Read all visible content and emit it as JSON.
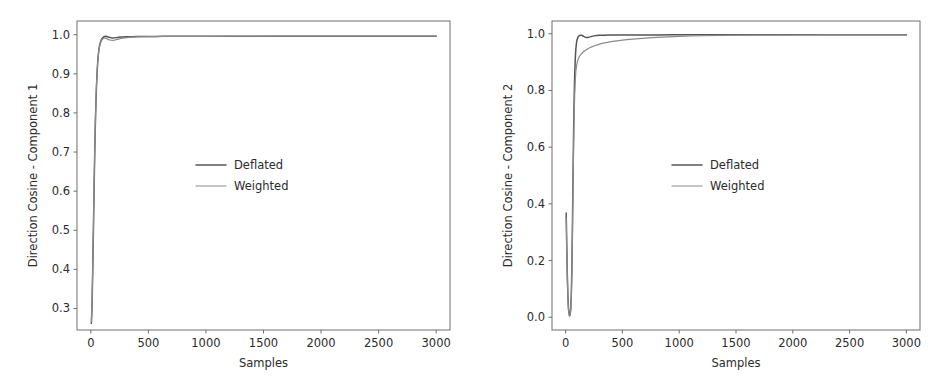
{
  "figure": {
    "background": "#ffffff",
    "width": 949,
    "height": 384,
    "panel_count": 2
  },
  "colors": {
    "deflated": "#555555",
    "weighted": "#8a8a8a",
    "axis": "#6e6e6e",
    "text": "#2b2b2b",
    "background": "#ffffff"
  },
  "chart_data": [
    {
      "type": "line",
      "title": "",
      "panel_name": "component-1",
      "xlabel": "Samples",
      "ylabel": "Direction Cosine - Component 1",
      "xlim": [
        -120,
        3120
      ],
      "ylim": [
        0.245,
        1.035
      ],
      "xticks": [
        0,
        500,
        1000,
        1500,
        2000,
        2500,
        3000
      ],
      "xticklabels": [
        "0",
        "500",
        "1000",
        "1500",
        "2000",
        "2500",
        "3000"
      ],
      "yticks": [
        0.3,
        0.4,
        0.5,
        0.6,
        0.7,
        0.8,
        0.9,
        1.0
      ],
      "yticklabels": [
        "0.3",
        "0.4",
        "0.5",
        "0.6",
        "0.7",
        "0.8",
        "0.9",
        "1.0"
      ],
      "grid": false,
      "legend_position": "center",
      "series": [
        {
          "name": "Deflated",
          "color": "#555555",
          "linewidth": 1.5,
          "x": [
            5,
            10,
            15,
            20,
            25,
            30,
            35,
            40,
            45,
            50,
            55,
            60,
            65,
            70,
            75,
            80,
            85,
            90,
            95,
            100,
            110,
            120,
            130,
            140,
            150,
            160,
            175,
            190,
            205,
            220,
            240,
            260,
            280,
            300,
            330,
            360,
            400,
            450,
            500,
            560,
            620,
            700,
            800,
            900,
            1000,
            1200,
            1400,
            1600,
            1800,
            2000,
            2200,
            2400,
            2600,
            2800,
            3000
          ],
          "y": [
            0.262,
            0.3,
            0.372,
            0.455,
            0.545,
            0.632,
            0.712,
            0.778,
            0.832,
            0.874,
            0.906,
            0.93,
            0.948,
            0.961,
            0.97,
            0.977,
            0.982,
            0.986,
            0.989,
            0.991,
            0.994,
            0.9955,
            0.9958,
            0.9952,
            0.9942,
            0.9932,
            0.9922,
            0.9918,
            0.992,
            0.9925,
            0.9932,
            0.9938,
            0.9942,
            0.9945,
            0.9948,
            0.995,
            0.9952,
            0.9954,
            0.9955,
            0.9956,
            0.9957,
            0.9958,
            0.9959,
            0.9959,
            0.996,
            0.996,
            0.9961,
            0.9961,
            0.9961,
            0.9962,
            0.9962,
            0.9962,
            0.9962,
            0.9962,
            0.9962
          ]
        },
        {
          "name": "Weighted",
          "color": "#8a8a8a",
          "linewidth": 1.2,
          "x": [
            5,
            10,
            15,
            20,
            25,
            30,
            35,
            40,
            45,
            50,
            55,
            60,
            65,
            70,
            75,
            80,
            85,
            90,
            95,
            100,
            110,
            120,
            130,
            140,
            150,
            160,
            175,
            190,
            205,
            220,
            240,
            260,
            280,
            300,
            330,
            360,
            400,
            450,
            500,
            560,
            620,
            700,
            800,
            900,
            1000,
            1200,
            1400,
            1600,
            1800,
            2000,
            2200,
            2400,
            2600,
            2800,
            3000
          ],
          "y": [
            0.266,
            0.305,
            0.378,
            0.462,
            0.552,
            0.639,
            0.718,
            0.783,
            0.836,
            0.877,
            0.908,
            0.931,
            0.948,
            0.96,
            0.969,
            0.975,
            0.98,
            0.9835,
            0.986,
            0.988,
            0.9905,
            0.9915,
            0.991,
            0.9895,
            0.988,
            0.9868,
            0.9858,
            0.9856,
            0.9862,
            0.9872,
            0.9888,
            0.9902,
            0.9913,
            0.9921,
            0.993,
            0.9936,
            0.9942,
            0.9947,
            0.995,
            0.9952,
            0.9954,
            0.9956,
            0.9957,
            0.9958,
            0.9959,
            0.996,
            0.996,
            0.9961,
            0.9961,
            0.9961,
            0.9961,
            0.9961,
            0.9962,
            0.9962,
            0.9962
          ]
        }
      ]
    },
    {
      "type": "line",
      "title": "",
      "panel_name": "component-2",
      "xlabel": "Samples",
      "ylabel": "Direction Cosine - Component 2",
      "xlim": [
        -120,
        3120
      ],
      "ylim": [
        -0.045,
        1.045
      ],
      "xticks": [
        0,
        500,
        1000,
        1500,
        2000,
        2500,
        3000
      ],
      "xticklabels": [
        "0",
        "500",
        "1000",
        "1500",
        "2000",
        "2500",
        "3000"
      ],
      "yticks": [
        0.0,
        0.2,
        0.4,
        0.6,
        0.8,
        1.0
      ],
      "yticklabels": [
        "0.0",
        "0.2",
        "0.4",
        "0.6",
        "0.8",
        "1.0"
      ],
      "grid": false,
      "legend_position": "center",
      "series": [
        {
          "name": "Deflated",
          "color": "#555555",
          "linewidth": 1.5,
          "x": [
            5,
            10,
            15,
            20,
            25,
            30,
            35,
            40,
            45,
            50,
            55,
            60,
            65,
            70,
            75,
            80,
            85,
            90,
            95,
            100,
            110,
            120,
            130,
            140,
            150,
            160,
            170,
            180,
            190,
            200,
            215,
            230,
            250,
            270,
            300,
            340,
            380,
            430,
            500,
            580,
            680,
            800,
            950,
            1100,
            1300,
            1500,
            1800,
            2100,
            2400,
            2700,
            3000
          ],
          "y": [
            0.368,
            0.25,
            0.148,
            0.075,
            0.032,
            0.012,
            0.006,
            0.01,
            0.03,
            0.08,
            0.175,
            0.32,
            0.49,
            0.65,
            0.775,
            0.86,
            0.913,
            0.946,
            0.966,
            0.978,
            0.989,
            0.9935,
            0.995,
            0.9948,
            0.993,
            0.9905,
            0.9882,
            0.9868,
            0.9865,
            0.9872,
            0.989,
            0.9908,
            0.9925,
            0.9935,
            0.9944,
            0.995,
            0.9953,
            0.9956,
            0.9958,
            0.9959,
            0.996,
            0.996,
            0.9961,
            0.9961,
            0.9961,
            0.9962,
            0.9962,
            0.9962,
            0.9962,
            0.9962,
            0.9962
          ]
        },
        {
          "name": "Weighted",
          "color": "#8a8a8a",
          "linewidth": 1.2,
          "x": [
            5,
            10,
            15,
            20,
            25,
            30,
            35,
            40,
            45,
            50,
            55,
            60,
            65,
            70,
            75,
            80,
            85,
            90,
            95,
            100,
            110,
            120,
            130,
            140,
            150,
            165,
            180,
            200,
            225,
            250,
            280,
            320,
            360,
            400,
            450,
            500,
            560,
            620,
            700,
            800,
            900,
            1000,
            1100,
            1200,
            1400,
            1600,
            1800,
            2000,
            2300,
            2600,
            3000
          ],
          "y": [
            0.352,
            0.238,
            0.138,
            0.068,
            0.026,
            0.008,
            0.004,
            0.009,
            0.027,
            0.072,
            0.16,
            0.295,
            0.452,
            0.6,
            0.712,
            0.788,
            0.836,
            0.866,
            0.884,
            0.896,
            0.91,
            0.919,
            0.925,
            0.93,
            0.934,
            0.939,
            0.943,
            0.948,
            0.953,
            0.957,
            0.961,
            0.966,
            0.969,
            0.972,
            0.975,
            0.9775,
            0.98,
            0.982,
            0.9845,
            0.9872,
            0.9892,
            0.9908,
            0.992,
            0.9929,
            0.9941,
            0.9949,
            0.9954,
            0.9956,
            0.9959,
            0.996,
            0.9961
          ]
        }
      ]
    }
  ]
}
